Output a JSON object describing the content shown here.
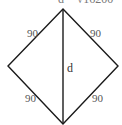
{
  "diagram": {
    "type": "square rotated (rhombus) with diagonal",
    "header_text_partial": "d = √16200",
    "side_labels": {
      "top_left": "90",
      "top_right": "90",
      "bottom_left": "90",
      "bottom_right": "90"
    },
    "diagonal_label": "d",
    "vertices": {
      "top": [
        63,
        9
      ],
      "left": [
        8,
        66
      ],
      "right": [
        118,
        66
      ],
      "bottom": [
        63,
        124
      ]
    },
    "stroke_color": "#1a1a1a",
    "label_color": "#555555"
  }
}
